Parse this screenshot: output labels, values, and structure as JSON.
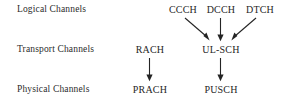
{
  "diagram": {
    "background_color": "#ffffff",
    "text_color": "#2b2b2b",
    "arrow_color": "#242424",
    "row_labels": [
      {
        "name": "logical",
        "text": "Logical Channels"
      },
      {
        "name": "transport",
        "text": "Transport Channels"
      },
      {
        "name": "physical",
        "text": "Physical Channels"
      }
    ],
    "nodes": {
      "logical": [
        {
          "id": "ccch",
          "text": "CCCH",
          "cx": 183
        },
        {
          "id": "dcch",
          "text": "DCCH",
          "cx": 221
        },
        {
          "id": "dtch",
          "text": "DTCH",
          "cx": 260
        }
      ],
      "transport": [
        {
          "id": "rach",
          "text": "RACH",
          "cx": 150
        },
        {
          "id": "ulsch",
          "text": "UL-SCH",
          "cx": 221
        }
      ],
      "physical": [
        {
          "id": "prach",
          "text": "PRACH",
          "cx": 150
        },
        {
          "id": "pusch",
          "text": "PUSCH",
          "cx": 221
        }
      ]
    },
    "edges": [
      {
        "id": "ccch-to-ulsch",
        "from": "CCCH",
        "to": "UL-SCH",
        "kind": "diagonal-down-right"
      },
      {
        "id": "dcch-to-ulsch",
        "from": "DCCH",
        "to": "UL-SCH",
        "kind": "vertical-down"
      },
      {
        "id": "dtch-to-ulsch",
        "from": "DTCH",
        "to": "UL-SCH",
        "kind": "diagonal-down-left"
      },
      {
        "id": "rach-to-prach",
        "from": "RACH",
        "to": "PRACH",
        "kind": "vertical-down"
      },
      {
        "id": "ulsch-to-pusch",
        "from": "UL-SCH",
        "to": "PUSCH",
        "kind": "vertical-down"
      }
    ]
  }
}
